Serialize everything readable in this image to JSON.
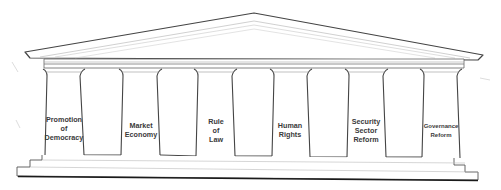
{
  "diagram": {
    "type": "temple-pillars",
    "stroke_color": "#3c3c3c",
    "fill_color": "#ffffff",
    "pillars": [
      {
        "label_lines": [
          "Promotion",
          "of",
          "Democracy"
        ],
        "center_x": 64,
        "label_top": 115
      },
      {
        "label_lines": [
          "Market",
          "Economy"
        ],
        "center_x": 141,
        "label_top": 121
      },
      {
        "label_lines": [
          "Rule",
          "of",
          "Law"
        ],
        "center_x": 216,
        "label_top": 117
      },
      {
        "label_lines": [
          "Human",
          "Rights"
        ],
        "center_x": 290,
        "label_top": 121
      },
      {
        "label_lines": [
          "Security",
          "Sector",
          "Reform"
        ],
        "center_x": 366,
        "label_top": 117
      },
      {
        "label_lines": [
          "Governance",
          "Reform"
        ],
        "center_x": 441,
        "label_top": 122
      }
    ]
  }
}
